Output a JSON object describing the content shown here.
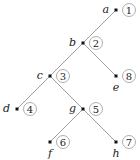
{
  "diagram": {
    "type": "binary-tree",
    "nodes": [
      {
        "id": "a",
        "number": "1",
        "x": 116,
        "y": 10,
        "label_pos": "left"
      },
      {
        "id": "b",
        "number": "2",
        "x": 83,
        "y": 43,
        "label_pos": "left"
      },
      {
        "id": "c",
        "number": "3",
        "x": 50,
        "y": 76,
        "label_pos": "left"
      },
      {
        "id": "e",
        "number": "8",
        "x": 116,
        "y": 76,
        "label_pos": "below"
      },
      {
        "id": "d",
        "number": "4",
        "x": 17,
        "y": 109,
        "label_pos": "left"
      },
      {
        "id": "g",
        "number": "5",
        "x": 83,
        "y": 109,
        "label_pos": "left"
      },
      {
        "id": "f",
        "number": "6",
        "x": 50,
        "y": 142,
        "label_pos": "below"
      },
      {
        "id": "h",
        "number": "7",
        "x": 116,
        "y": 142,
        "label_pos": "below"
      }
    ],
    "edges": [
      [
        "a",
        "b"
      ],
      [
        "b",
        "c"
      ],
      [
        "b",
        "e"
      ],
      [
        "c",
        "d"
      ],
      [
        "c",
        "g"
      ],
      [
        "g",
        "f"
      ],
      [
        "g",
        "h"
      ]
    ]
  }
}
